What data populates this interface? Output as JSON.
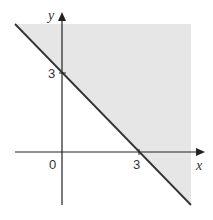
{
  "diagram": {
    "type": "inequality-region",
    "boundary_line": "x + y = 3",
    "shaded_region": "x + y >= 3",
    "colors": {
      "shade": "#e6e6e6",
      "line": "#333333",
      "axes": "#222222"
    },
    "labels": {
      "x_axis": "x",
      "y_axis": "y",
      "origin": "0",
      "x_intercept": "3",
      "y_intercept": "3"
    }
  }
}
